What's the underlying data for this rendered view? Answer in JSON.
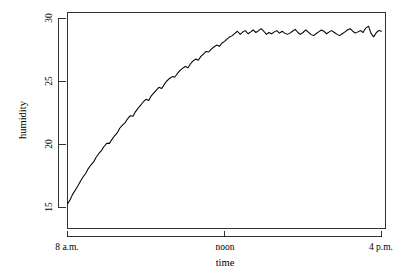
{
  "chart_data": {
    "type": "line",
    "title": "",
    "xlabel": "time",
    "ylabel": "humidity",
    "grid": false,
    "legend": null,
    "ylim": [
      14.0,
      30.5
    ],
    "xlim": [
      8.0,
      16.0
    ],
    "y_ticks": [
      15,
      20,
      25,
      30
    ],
    "y_tick_labels": [
      "15",
      "20",
      "25",
      "30"
    ],
    "x_ticks": [
      8,
      12,
      16
    ],
    "x_tick_labels": [
      "8 a.m.",
      "noon",
      "4 p.m."
    ],
    "line_color": "#000000",
    "series": [
      {
        "name": "humidity",
        "x": [
          8.0,
          8.07,
          8.13,
          8.2,
          8.27,
          8.33,
          8.4,
          8.47,
          8.53,
          8.6,
          8.67,
          8.73,
          8.8,
          8.87,
          8.93,
          9.0,
          9.07,
          9.13,
          9.2,
          9.27,
          9.33,
          9.4,
          9.47,
          9.53,
          9.6,
          9.67,
          9.73,
          9.8,
          9.87,
          9.93,
          10.0,
          10.07,
          10.13,
          10.2,
          10.27,
          10.33,
          10.4,
          10.47,
          10.53,
          10.6,
          10.67,
          10.73,
          10.8,
          10.87,
          10.93,
          11.0,
          11.07,
          11.13,
          11.2,
          11.27,
          11.33,
          11.4,
          11.47,
          11.53,
          11.6,
          11.67,
          11.73,
          11.8,
          11.87,
          11.93,
          12.0,
          12.07,
          12.13,
          12.2,
          12.27,
          12.33,
          12.4,
          12.47,
          12.53,
          12.6,
          12.67,
          12.73,
          12.8,
          12.87,
          12.93,
          13.0,
          13.07,
          13.13,
          13.2,
          13.27,
          13.33,
          13.4,
          13.47,
          13.53,
          13.6,
          13.67,
          13.73,
          13.8,
          13.87,
          13.93,
          14.0,
          14.07,
          14.13,
          14.2,
          14.27,
          14.33,
          14.4,
          14.47,
          14.53,
          14.6,
          14.67,
          14.73,
          14.8,
          14.87,
          14.93,
          15.0,
          15.07,
          15.13,
          15.2,
          15.27,
          15.33,
          15.4,
          15.47,
          15.53,
          15.6,
          15.67,
          15.73,
          15.8,
          15.87,
          15.93,
          16.0
        ],
        "y": [
          15.25,
          15.6,
          16.0,
          16.35,
          16.7,
          17.05,
          17.4,
          17.7,
          18.05,
          18.35,
          18.6,
          18.95,
          19.25,
          19.5,
          19.8,
          20.05,
          20.05,
          20.35,
          20.65,
          20.9,
          21.25,
          21.5,
          21.7,
          22.0,
          22.25,
          22.2,
          22.55,
          22.85,
          23.1,
          23.35,
          23.55,
          23.45,
          23.8,
          24.05,
          24.3,
          24.5,
          24.4,
          24.75,
          25.0,
          25.2,
          25.35,
          25.3,
          25.6,
          25.85,
          26.0,
          26.15,
          26.05,
          26.35,
          26.6,
          26.75,
          26.65,
          26.95,
          27.15,
          27.35,
          27.3,
          27.55,
          27.7,
          27.85,
          27.75,
          28.0,
          28.15,
          28.35,
          28.5,
          28.6,
          28.8,
          28.95,
          28.7,
          28.9,
          29.0,
          28.75,
          28.9,
          29.05,
          28.85,
          29.0,
          29.15,
          28.95,
          28.7,
          28.85,
          28.75,
          28.9,
          29.0,
          28.8,
          28.95,
          28.8,
          28.7,
          28.8,
          28.95,
          29.1,
          28.85,
          28.7,
          28.85,
          29.05,
          28.9,
          28.7,
          28.6,
          28.75,
          28.9,
          29.05,
          28.95,
          28.75,
          28.9,
          29.0,
          28.85,
          28.7,
          28.6,
          28.75,
          28.9,
          29.05,
          29.15,
          28.95,
          28.8,
          28.9,
          29.0,
          28.85,
          29.2,
          29.35,
          28.8,
          28.5,
          28.85,
          29.0,
          28.95
        ]
      }
    ]
  },
  "axes": {
    "y_title": "humidity",
    "x_title": "time"
  }
}
